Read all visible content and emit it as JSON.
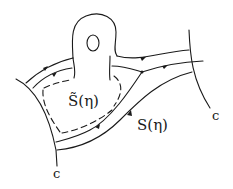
{
  "diagram": {
    "labels": {
      "inner_region": "S̃(η)",
      "outer_region": "S(η)",
      "curve_left": "c",
      "curve_right": "c",
      "hole": "O"
    },
    "colors": {
      "ink": "#1a1a1a",
      "background": "#ffffff"
    }
  }
}
